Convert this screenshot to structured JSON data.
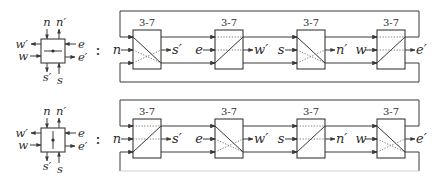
{
  "figure": {
    "rows": [
      {
        "node_icon": {
          "inner_orientation": "horizontal",
          "labels": {
            "n": "n",
            "n_prime": "n′",
            "w_prime": "w′",
            "w": "w",
            "e": "e",
            "e_prime": "e′",
            "s_prime": "s′",
            "s": "s"
          }
        },
        "separator": ":",
        "stages": [
          {
            "label": "3-7",
            "input": "n",
            "output": "s′",
            "state": "cross-down"
          },
          {
            "label": "3-7",
            "input": "e",
            "output": "w′",
            "state": "bar-up"
          },
          {
            "label": "3-7",
            "input": "s",
            "output": "n′",
            "state": "cross-down"
          },
          {
            "label": "3-7",
            "input": "w",
            "output": "e′",
            "state": "bar-up"
          }
        ]
      },
      {
        "node_icon": {
          "inner_orientation": "vertical",
          "labels": {
            "n": "n",
            "n_prime": "n′",
            "w_prime": "w′",
            "w": "w",
            "e": "e",
            "e_prime": "e′",
            "s_prime": "s′",
            "s": "s"
          }
        },
        "separator": ":",
        "stages": [
          {
            "label": "3-7",
            "input": "n",
            "output": "s′",
            "state": "bar-up"
          },
          {
            "label": "3-7",
            "input": "e",
            "output": "w′",
            "state": "cross-down"
          },
          {
            "label": "3-7",
            "input": "s",
            "output": "n′",
            "state": "bar-up"
          },
          {
            "label": "3-7",
            "input": "w",
            "output": "e′",
            "state": "cross-down"
          }
        ]
      }
    ]
  }
}
